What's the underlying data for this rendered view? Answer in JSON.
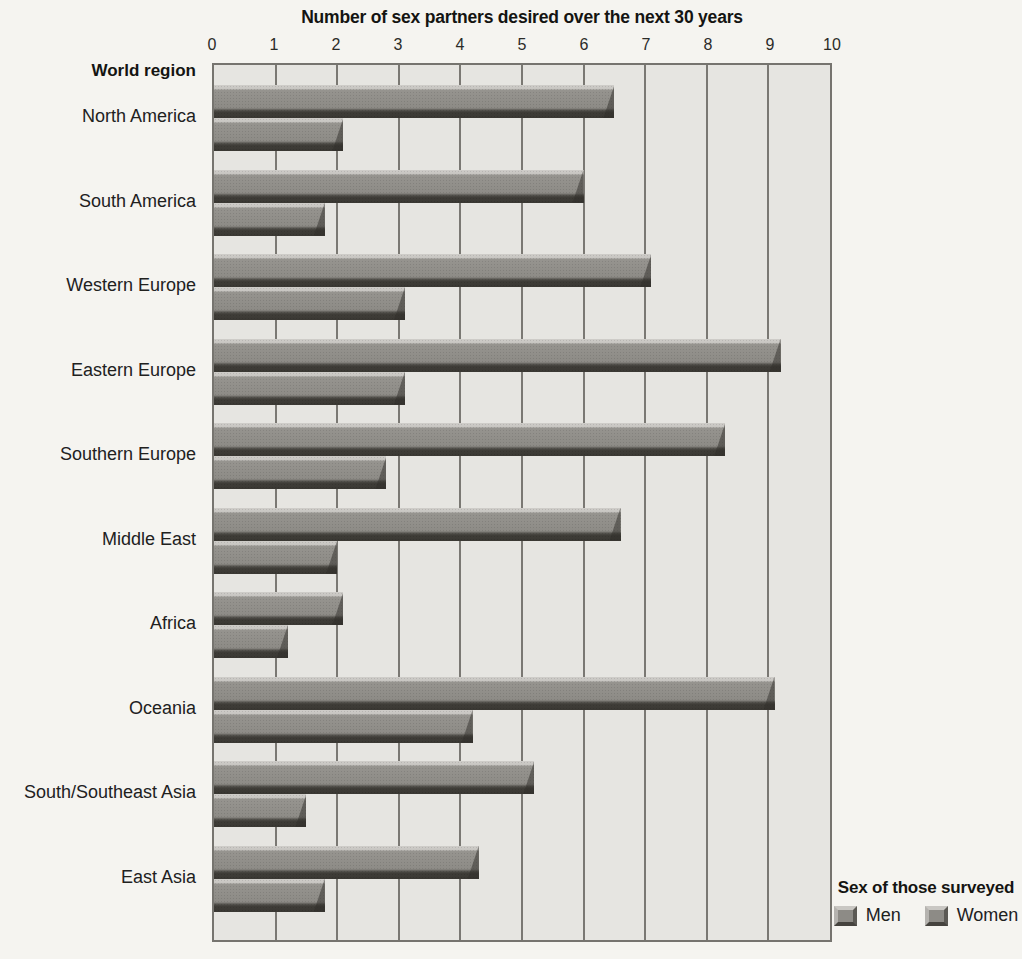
{
  "chart_data": {
    "type": "bar",
    "orientation": "horizontal",
    "title": "Number of sex partners desired over the next 30 years",
    "category_axis_title": "World region",
    "xlim": [
      0,
      10
    ],
    "x_ticks": [
      0,
      1,
      2,
      3,
      4,
      5,
      6,
      7,
      8,
      9,
      10
    ],
    "grid": true,
    "categories": [
      "North America",
      "South America",
      "Western Europe",
      "Eastern Europe",
      "Southern Europe",
      "Middle East",
      "Africa",
      "Oceania",
      "South/Southeast Asia",
      "East Asia"
    ],
    "series": [
      {
        "name": "Men",
        "values": [
          6.5,
          6.0,
          7.1,
          9.2,
          8.3,
          6.6,
          2.1,
          9.1,
          5.2,
          4.3
        ]
      },
      {
        "name": "Women",
        "values": [
          2.1,
          1.8,
          3.1,
          3.1,
          2.8,
          2.0,
          1.2,
          4.2,
          1.5,
          1.8
        ]
      }
    ],
    "legend": {
      "title": "Sex of those surveyed",
      "items": [
        "Men",
        "Women"
      ],
      "position": "inside bottom-right"
    }
  },
  "colors": {
    "page_bg": "#f5f4f0",
    "plot_bg": "#e6e5e1",
    "bar_face": "#8d8b86",
    "bar_highlight": "#c9c7c3",
    "bar_shadow": "#3f3d38",
    "gridline": "#7a7873",
    "text": "#1a1a17"
  }
}
